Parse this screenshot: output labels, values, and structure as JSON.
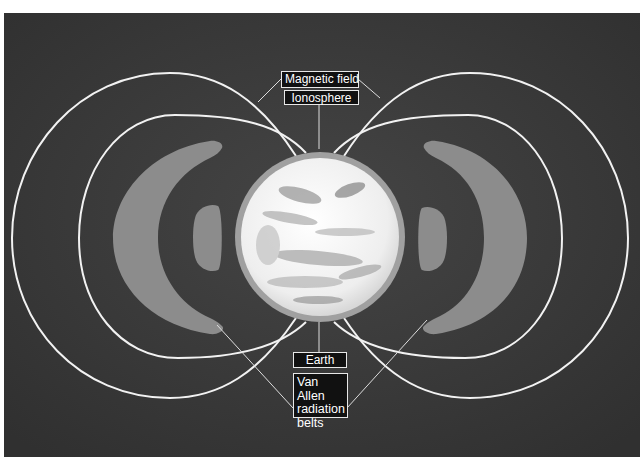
{
  "diagram": {
    "labels": {
      "magnetic_field": "Magnetic field",
      "ionosphere": "Ionosphere",
      "earth": "Earth",
      "van_allen": "Van Allen radiation belts"
    },
    "van_allen_lines": [
      "Van Allen",
      "radiation",
      "belts"
    ],
    "colors": {
      "background": "#3b3b3b",
      "field_lines": "#f2f2f2",
      "belts": "#8c8c8c",
      "ionosphere_ring": "#a0a0a0",
      "earth": "#f4f4f4",
      "label_bg": "#111111",
      "label_text": "#ffffff"
    }
  }
}
